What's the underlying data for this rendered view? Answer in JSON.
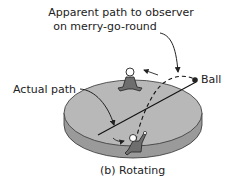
{
  "labels": {
    "apparent_path_line1": "Apparent path to observer",
    "apparent_path_line2": "on merry-go-round",
    "actual_path": "Actual path",
    "ball": "Ball",
    "caption": "(b) Rotating"
  },
  "colors": {
    "disk_top": "#b8b8b8",
    "disk_side": "#9a9a9a",
    "outline": "#333333",
    "figure_fill": "#6e6e6e",
    "head_fill": "#ffffff",
    "text": "#222222"
  }
}
